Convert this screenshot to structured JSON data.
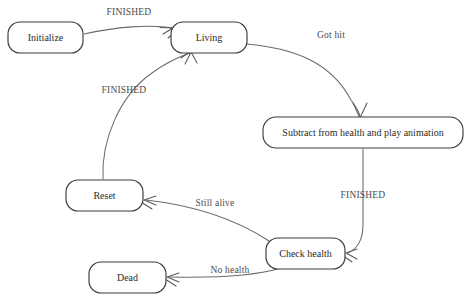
{
  "diagram": {
    "type": "state-machine-diagram",
    "title": "",
    "canvas": {
      "width": 469,
      "height": 306,
      "background": "#ffffff"
    },
    "style": {
      "node_stroke": "#3a3a3a",
      "node_fill": "#ffffff",
      "edge_stroke": "#6a6a6a",
      "node_text": "#2b2b2b",
      "edge_text": "#4a4a4a"
    },
    "nodes": [
      {
        "id": "initialize",
        "label": "Initialize",
        "x": 8,
        "y": 22,
        "w": 75,
        "h": 31,
        "cx": 45.5,
        "cy": 37.5
      },
      {
        "id": "living",
        "label": "Living",
        "x": 171,
        "y": 22,
        "w": 76,
        "h": 31,
        "cx": 209,
        "cy": 37.5
      },
      {
        "id": "subtract",
        "label": "Subtract from health and play animation",
        "x": 263,
        "y": 117,
        "w": 200,
        "h": 31,
        "cx": 363,
        "cy": 132.5
      },
      {
        "id": "reset",
        "label": "Reset",
        "x": 66,
        "y": 180,
        "w": 77,
        "h": 31,
        "cx": 104.5,
        "cy": 195.5
      },
      {
        "id": "checkhealth",
        "label": "Check health",
        "x": 266,
        "y": 238,
        "w": 79,
        "h": 31,
        "cx": 305.5,
        "cy": 253.5
      },
      {
        "id": "dead",
        "label": "Dead",
        "x": 89,
        "y": 262,
        "w": 77,
        "h": 31,
        "cx": 127.5,
        "cy": 277.5
      }
    ],
    "edges": [
      {
        "id": "init-to-living",
        "from": "initialize",
        "to": "living",
        "label": "FINISHED",
        "label_x": 129,
        "label_y": 13
      },
      {
        "id": "living-to-subtract",
        "from": "living",
        "to": "subtract",
        "label": "Got hit",
        "label_x": 331,
        "label_y": 36
      },
      {
        "id": "subtract-to-check",
        "from": "subtract",
        "to": "checkhealth",
        "label": "FINISHED",
        "label_x": 363,
        "label_y": 196
      },
      {
        "id": "check-to-reset",
        "from": "checkhealth",
        "to": "reset",
        "label": "Still alive",
        "label_x": 215,
        "label_y": 204
      },
      {
        "id": "check-to-dead",
        "from": "checkhealth",
        "to": "dead",
        "label": "No health",
        "label_x": 230,
        "label_y": 271
      },
      {
        "id": "reset-to-living",
        "from": "reset",
        "to": "living",
        "label": "FINISHED",
        "label_x": 124,
        "label_y": 91
      }
    ]
  }
}
